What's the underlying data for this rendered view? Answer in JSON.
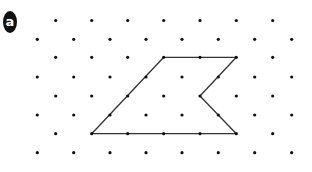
{
  "label": {
    "text": "a"
  },
  "grid": {
    "dot_color": "#111111",
    "dot_radius": 1.6,
    "rows": [
      {
        "y": 20.5,
        "xs": [
          55.7,
          91.7,
          127.7,
          163.7,
          200,
          236.3,
          272.7
        ]
      },
      {
        "y": 39.3,
        "xs": [
          37.3,
          73.7,
          110,
          146,
          182,
          218.3,
          254.7,
          291.7
        ]
      },
      {
        "y": 57.3,
        "xs": [
          55.7,
          91.7,
          127.7,
          163.7,
          200,
          236.3,
          272.7
        ]
      },
      {
        "y": 77,
        "xs": [
          37.3,
          73.7,
          110,
          146,
          182,
          218.3,
          254.7,
          291.7
        ]
      },
      {
        "y": 96,
        "xs": [
          55.7,
          91.7,
          127.7,
          163.7,
          200,
          236.3,
          272.7
        ]
      },
      {
        "y": 115,
        "xs": [
          37.3,
          73.7,
          110,
          146,
          182,
          218.3,
          254.7,
          291.7
        ]
      },
      {
        "y": 133.7,
        "xs": [
          55.7,
          91.7,
          127.7,
          163.7,
          200,
          236.3,
          272.7
        ]
      },
      {
        "y": 152.7,
        "xs": [
          37.3,
          73.7,
          110,
          146,
          182,
          218.3,
          254.7,
          291.7
        ]
      }
    ]
  },
  "polygon": {
    "stroke": "#333333",
    "stroke_width": 1.3,
    "vertices": [
      [
        163.7,
        57.3
      ],
      [
        236.3,
        57.3
      ],
      [
        200,
        96
      ],
      [
        236.3,
        133.7
      ],
      [
        91.7,
        133.7
      ]
    ]
  }
}
